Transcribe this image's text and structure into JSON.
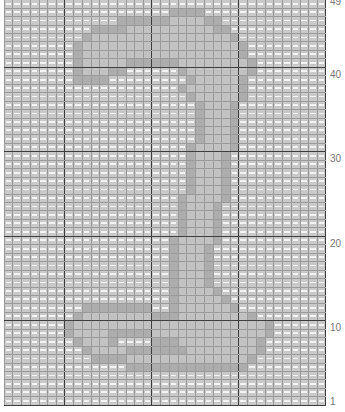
{
  "chart_data": {
    "type": "heatmap",
    "title": "",
    "columns": 37,
    "rows": 49,
    "row_labels": [
      {
        "row": 49,
        "label": "49"
      },
      {
        "row": 40,
        "label": "40"
      },
      {
        "row": 30,
        "label": "30"
      },
      {
        "row": 20,
        "label": "20"
      },
      {
        "row": 10,
        "label": "10"
      },
      {
        "row": 1,
        "label": "1"
      }
    ],
    "legend": {
      ".": "background stitch",
      "o": "motif outline stitch",
      "f": "motif fill stitch"
    },
    "grid": [
      ".....................................",
      ".....................................",
      "...................oooo..............",
      ".............ooooooffffoo............",
      "..........ooooffffffffffoo...........",
      ".........offffffffffffffffo..........",
      "........offffffffffffffffffo.........",
      "........offffffffffffffffffo.........",
      "........offfffooooooffffffffo........",
      "........offfoo......offfffffo........",
      "........oooo.........offfffo.........",
      "....................offffffo.........",
      ".....................offfffo.........",
      "......................offfo..........",
      "......................offfo..........",
      "......................offfo..........",
      "......................offfo..........",
      "......................offfo..........",
      ".....................offffo..........",
      ".....................offfo...........",
      ".....................offfo...........",
      ".....................offfo...........",
      ".....................offfo...........",
      ".....................offfo...........",
      "....................offffo...........",
      "....................offfo............",
      "....................offfo............",
      "....................offfo............",
      "....................offfo............",
      "...................offffo............",
      "...................offfo.............",
      "...................offfo.............",
      "...................offfo.............",
      "...................offfo.............",
      "...................offfo.............",
      "...................offffo............",
      "...................offfffo...........",
      ".........oooooooo..offffffo..........",
      "........offffffffoooffffffffo........",
      ".......offffffffffffffffffffffo......",
      ".......offffooooofffffffffffffo......",
      "........offfo....ooofffffffffo.......",
      ".........offffoooooooffffffffo.......",
      "..........ooooffffffffffffffo........",
      "..............oooooooooooooo.........",
      ".....................................",
      ".....................................",
      ".....................................",
      "....................................."
    ]
  }
}
